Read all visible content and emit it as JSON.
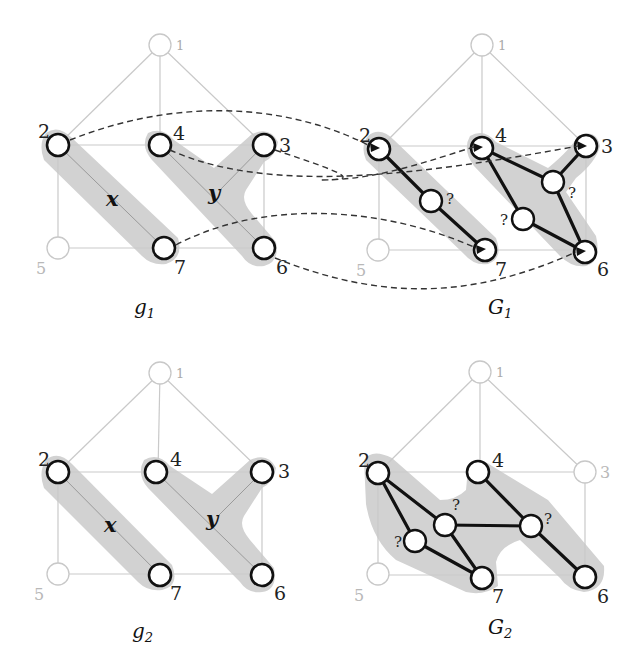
{
  "panels": {
    "g1": {
      "caption": "g",
      "caption_sub": "1",
      "nodes": {
        "n1": "1",
        "n2": "2",
        "n3": "3",
        "n4": "4",
        "n5": "5",
        "n6": "6",
        "n7": "7"
      },
      "sets": {
        "x": "x",
        "y": "y"
      }
    },
    "G1": {
      "caption": "G",
      "caption_sub": "1",
      "nodes": {
        "n1": "1",
        "n2": "2",
        "n3": "3",
        "n4": "4",
        "n5": "5",
        "n6": "6",
        "n7": "7"
      },
      "unknown_nodes": [
        "?",
        "?",
        "?"
      ]
    },
    "g2": {
      "caption": "g",
      "caption_sub": "2",
      "nodes": {
        "n1": "1",
        "n2": "2",
        "n3": "3",
        "n4": "4",
        "n5": "5",
        "n6": "6",
        "n7": "7"
      },
      "sets": {
        "x": "x",
        "y": "y"
      }
    },
    "G2": {
      "caption": "G",
      "caption_sub": "2",
      "nodes": {
        "n1": "1",
        "n2": "2",
        "n3": "3",
        "n4": "4",
        "n5": "5",
        "n6": "6",
        "n7": "7"
      },
      "unknown_nodes": [
        "?",
        "?",
        "?"
      ]
    }
  },
  "mappings_g1_to_G1": [
    {
      "from": "2",
      "to": "2"
    },
    {
      "from": "4",
      "to": "3"
    },
    {
      "from": "3",
      "to": "4"
    },
    {
      "from": "7",
      "to": "6"
    },
    {
      "from": "6",
      "to": "7"
    }
  ]
}
